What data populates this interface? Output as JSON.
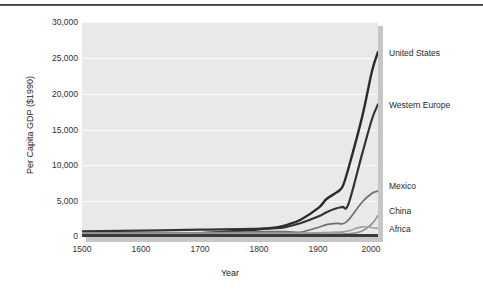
{
  "figure": {
    "background": "#ffffff",
    "plot_background": "#e9e9e9"
  },
  "axes": {
    "y_title": "Per Capita GDP ($1990)",
    "x_title": "Year",
    "y_ticks": [
      "30,000",
      "25,000",
      "20,000",
      "15,000",
      "10,000",
      "5,000",
      "0"
    ],
    "x_ticks": [
      "1500",
      "1600",
      "1700",
      "1800",
      "1900",
      "2000"
    ]
  },
  "series_labels": {
    "united_states": "United States",
    "western_europe": "Western Europe",
    "mexico": "Mexico",
    "china": "China",
    "africa": "Africa"
  },
  "chart_data": {
    "type": "line",
    "title": "",
    "xlabel": "Year",
    "ylabel": "Per Capita GDP ($1990)",
    "xlim": [
      1500,
      2000
    ],
    "ylim": [
      0,
      30000
    ],
    "xticks": [
      1500,
      1600,
      1700,
      1800,
      1900,
      2000
    ],
    "yticks": [
      0,
      5000,
      10000,
      15000,
      20000,
      25000,
      30000
    ],
    "grid": "horizontal",
    "legend": "inline-right-labels",
    "x": [
      1500,
      1600,
      1700,
      1820,
      1850,
      1870,
      1900,
      1913,
      1930,
      1940,
      1950,
      1973,
      1990,
      2000
    ],
    "series": [
      {
        "name": "United States",
        "color": "#2b2b2b",
        "values": [
          400,
          400,
          527,
          1257,
          1806,
          2445,
          4091,
          5301,
          6220,
          7010,
          9561,
          16689,
          23200,
          25800
        ]
      },
      {
        "name": "Western Europe",
        "color": "#333333",
        "values": [
          771,
          890,
          1024,
          1202,
          1500,
          1960,
          2885,
          3458,
          4000,
          4200,
          4579,
          11534,
          16500,
          18500
        ]
      },
      {
        "name": "Mexico",
        "color": "#6e6e6e",
        "values": [
          425,
          454,
          568,
          759,
          720,
          674,
          1366,
          1732,
          1900,
          1850,
          2365,
          4845,
          6100,
          6400
        ]
      },
      {
        "name": "China",
        "color": "#8c8c8c",
        "values": [
          600,
          600,
          600,
          600,
          600,
          530,
          545,
          552,
          568,
          560,
          439,
          839,
          1858,
          3000
        ]
      },
      {
        "name": "Africa",
        "color": "#a0a0a0",
        "values": [
          414,
          422,
          421,
          420,
          440,
          500,
          601,
          637,
          700,
          720,
          852,
          1410,
          1300,
          1200
        ]
      }
    ]
  }
}
